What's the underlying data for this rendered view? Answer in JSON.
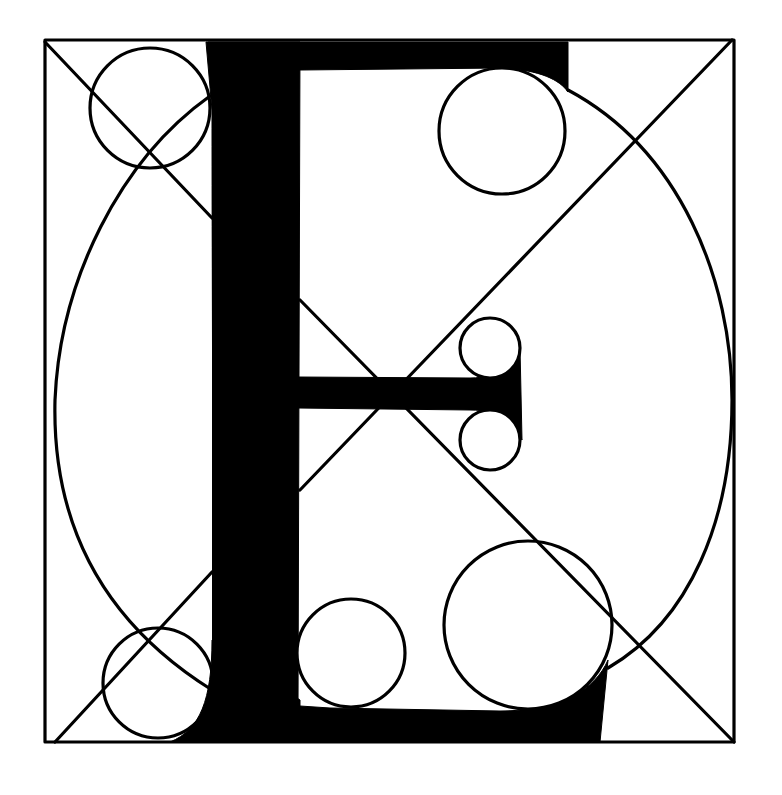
{
  "letter": "E",
  "colors": {
    "ink": "#000000",
    "paper": "#ffffff"
  },
  "frame": {
    "x1": 45,
    "y1": 40,
    "x2": 734,
    "y2": 742
  },
  "diagonals": [
    {
      "name": "diagonal-tl-br",
      "x1": 45,
      "y1": 42,
      "x2": 734,
      "y2": 742
    },
    {
      "name": "diagonal-tr-bl",
      "x1": 732,
      "y1": 40,
      "x2": 55,
      "y2": 742
    }
  ],
  "ellipse": {
    "cx": 390,
    "cy": 392,
    "rx": 340,
    "ry": 350
  },
  "stem": {
    "x1": 212,
    "y1": 42,
    "x2": 300,
    "y2": 742
  },
  "top_arm": {
    "x1": 212,
    "y1": 42,
    "x2": 568,
    "y2": 70
  },
  "middle_arm": {
    "x1": 300,
    "y1": 377,
    "x2": 522,
    "y2": 408
  },
  "bottom_arm": {
    "x1": 212,
    "y1": 706,
    "x2": 602,
    "y2": 742
  },
  "circles": [
    {
      "name": "circle-top-left-corner",
      "cx": 150,
      "cy": 108,
      "r": 60,
      "filled_hole": false
    },
    {
      "name": "circle-top-serif",
      "cx": 502,
      "cy": 131,
      "r": 63,
      "filled_hole": true
    },
    {
      "name": "circle-middle-serif-upper",
      "cx": 490,
      "cy": 348,
      "r": 30,
      "filled_hole": true
    },
    {
      "name": "circle-middle-serif-lower",
      "cx": 490,
      "cy": 440,
      "r": 30,
      "filled_hole": true
    },
    {
      "name": "circle-bottom-left-corner",
      "cx": 158,
      "cy": 683,
      "r": 55,
      "filled_hole": false
    },
    {
      "name": "circle-bottom-inner",
      "cx": 351,
      "cy": 653,
      "r": 54,
      "filled_hole": true
    },
    {
      "name": "circle-bottom-serif",
      "cx": 528,
      "cy": 625,
      "r": 84,
      "filled_hole": true
    }
  ]
}
